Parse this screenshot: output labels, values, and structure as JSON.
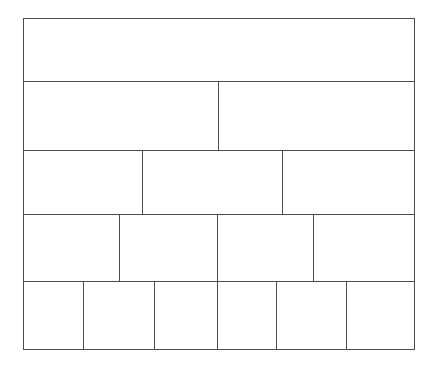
{
  "figure": {
    "kind": "brick-bond-diagram",
    "canvas": {
      "width": 438,
      "height": 366,
      "background": "#ffffff"
    },
    "outline": {
      "x": 23,
      "y": 18,
      "width": 392,
      "height": 332,
      "stroke_color": "#4d4d4d",
      "stroke_width": 1
    },
    "line_color": "#4d4d4d",
    "line_width": 1
  },
  "chart_data": {
    "type": "diagram",
    "xlabel": "",
    "ylabel": "",
    "units": "pixels",
    "origin": {
      "x": 23,
      "y": 18
    },
    "total_width": 392,
    "total_height": 332,
    "course_count": 5,
    "brick_count": 16,
    "course_boundaries_y": [
      18,
      82,
      151,
      215,
      282,
      350
    ],
    "course_heights": [
      64,
      69,
      64,
      67,
      68
    ],
    "vertical_joints_x": {
      "course_1": [],
      "course_2": [
        219
      ],
      "course_3": [
        143,
        283
      ],
      "course_4": [
        119,
        218,
        315
      ],
      "course_5": [
        83,
        155,
        218,
        277,
        348
      ]
    },
    "courses": [
      {
        "index": 1,
        "label": "Course 1",
        "top": 18,
        "height": 64,
        "brick_count": 1,
        "bricks": [
          {
            "label": "Brick 1-1",
            "x": 23,
            "width": 392
          }
        ]
      },
      {
        "index": 2,
        "label": "Course 2",
        "top": 82,
        "height": 69,
        "brick_count": 2,
        "bricks": [
          {
            "label": "Brick 2-1",
            "x": 23,
            "width": 196
          },
          {
            "label": "Brick 2-2",
            "x": 219,
            "width": 196
          }
        ]
      },
      {
        "index": 3,
        "label": "Course 3",
        "top": 151,
        "height": 64,
        "brick_count": 3,
        "bricks": [
          {
            "label": "Brick 3-1",
            "x": 23,
            "width": 120
          },
          {
            "label": "Brick 3-2",
            "x": 143,
            "width": 140
          },
          {
            "label": "Brick 3-3",
            "x": 283,
            "width": 132
          }
        ]
      },
      {
        "index": 4,
        "label": "Course 4",
        "top": 215,
        "height": 67,
        "brick_count": 4,
        "bricks": [
          {
            "label": "Brick 4-1",
            "x": 23,
            "width": 96
          },
          {
            "label": "Brick 4-2",
            "x": 119,
            "width": 99
          },
          {
            "label": "Brick 4-3",
            "x": 218,
            "width": 97
          },
          {
            "label": "Brick 4-4",
            "x": 315,
            "width": 100
          }
        ]
      },
      {
        "index": 5,
        "label": "Course 5",
        "top": 282,
        "height": 68,
        "brick_count": 6,
        "bricks": [
          {
            "label": "Brick 5-1",
            "x": 23,
            "width": 60
          },
          {
            "label": "Brick 5-2",
            "x": 83,
            "width": 72
          },
          {
            "label": "Brick 5-3",
            "x": 155,
            "width": 63
          },
          {
            "label": "Brick 5-4",
            "x": 218,
            "width": 59
          },
          {
            "label": "Brick 5-5",
            "x": 277,
            "width": 71
          },
          {
            "label": "Brick 5-6",
            "x": 348,
            "width": 67
          }
        ]
      }
    ]
  }
}
